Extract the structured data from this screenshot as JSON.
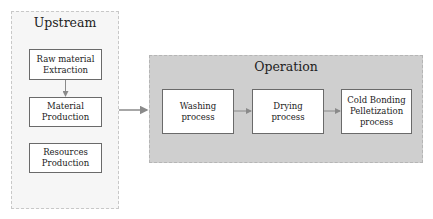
{
  "upstream": {
    "title": "Upstream",
    "boxes": [
      {
        "label": "Raw material\nExtraction"
      },
      {
        "label": "Material\nProduction"
      },
      {
        "label": "Resources\nProduction"
      }
    ]
  },
  "operation": {
    "title": "Operation",
    "boxes": [
      {
        "label": "Washing\nprocess"
      },
      {
        "label": "Drying\nprocess"
      },
      {
        "label": "Cold Bonding\nPelletization\nprocess"
      }
    ]
  },
  "colors": {
    "upstream_fill": "#f6f6f6",
    "operation_fill": "#cfcfcf",
    "arrow": "#8a8a8a",
    "box_border": "#6a6a6a"
  }
}
